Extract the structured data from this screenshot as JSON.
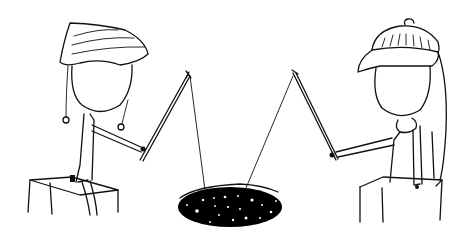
{
  "scene": {
    "description": "Two cartoon figures sitting on blocks, fishing with rods into a dark starry hole between them",
    "background": "#ffffff",
    "ink_color": "#111111",
    "hole_color": "#000000",
    "star_color": "#ffffff",
    "left_figure": {
      "hat": "striped nightcap with two pompom tassels",
      "seat": "box"
    },
    "right_figure": {
      "hat": "knit beanie with pompom",
      "accessory": "scarf",
      "seat": "box"
    },
    "hole": {
      "shape": "ellipse",
      "stars": 18
    }
  }
}
